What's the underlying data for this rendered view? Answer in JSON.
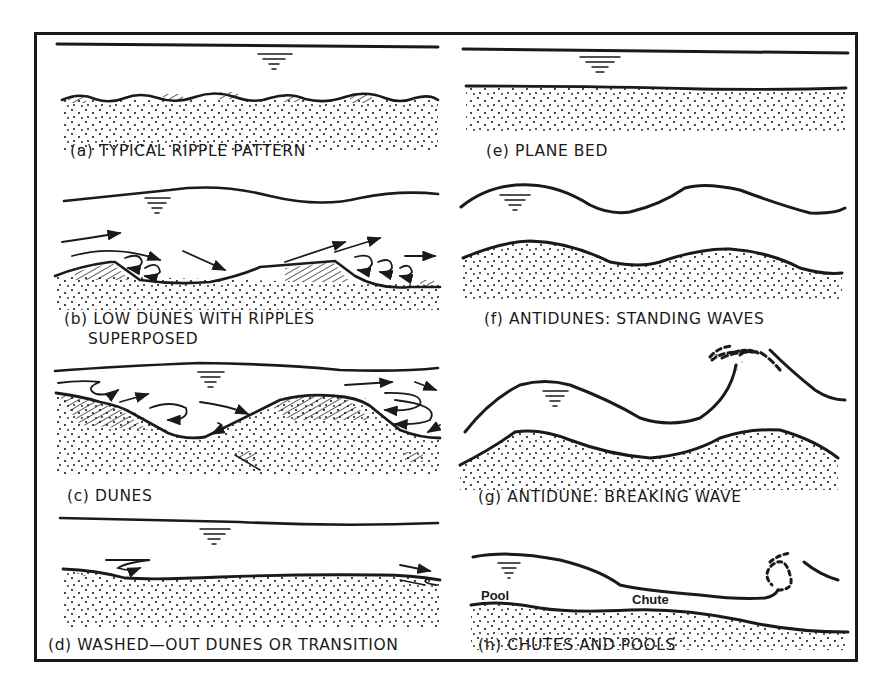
{
  "figure": {
    "ink_color": "#1a1a1a",
    "background": "#ffffff"
  },
  "panels": {
    "a": {
      "label": "(a) TYPICAL RIPPLE PATTERN"
    },
    "b": {
      "label_line1": "(b) LOW DUNES WITH RIPPLES",
      "label_line2": "SUPERPOSED"
    },
    "c": {
      "label": "(c) DUNES"
    },
    "d": {
      "label": "(d) WASHED—OUT DUNES OR TRANSITION"
    },
    "e": {
      "label": "(e) PLANE BED"
    },
    "f": {
      "label": "(f) ANTIDUNES: STANDING WAVES"
    },
    "g": {
      "label": "(g) ANTIDUNE: BREAKING WAVE"
    },
    "h": {
      "label": "(h) CHUTES AND POOLS",
      "annotations": {
        "pool": "Pool",
        "chute": "Chute"
      }
    }
  },
  "symbols": {
    "water_surface": "water-surface-symbol",
    "sediment": "stippled-sand-bed",
    "flow": "flow-arrow"
  }
}
